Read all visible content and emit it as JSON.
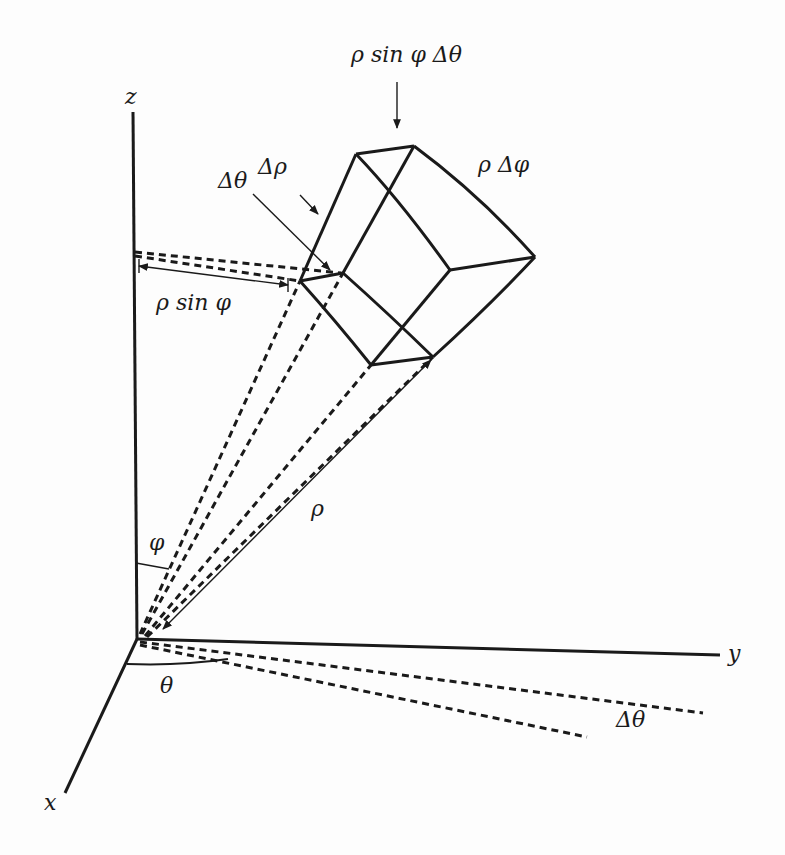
{
  "diagram": {
    "axes": {
      "x": "x",
      "y": "y",
      "z": "z"
    },
    "labels": {
      "top_arc": "ρ sin φ Δθ",
      "right_edge": "ρ Δφ",
      "delta_rho": "Δρ",
      "delta_theta_box": "Δθ",
      "rho_sin_phi": "ρ sin φ",
      "rho": "ρ",
      "phi": "φ",
      "theta": "θ",
      "delta_theta_base": "Δθ"
    },
    "colors": {
      "ink": "#1a1a1a",
      "background": "#fdfdfd"
    }
  }
}
